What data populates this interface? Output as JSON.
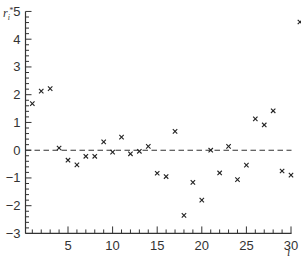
{
  "chart_data": {
    "type": "scatter",
    "title": "",
    "xlabel": "i",
    "ylabel": "r_i*",
    "ylabel_display": {
      "base": "r",
      "sub": "i",
      "sup": "*"
    },
    "xlim": [
      0,
      31
    ],
    "ylim": [
      -3,
      5
    ],
    "xticks": [
      5,
      10,
      15,
      20,
      25,
      30
    ],
    "yticks": [
      -3,
      -2,
      -1,
      0,
      1,
      2,
      3,
      4,
      5
    ],
    "x_minor_step": 1,
    "y_minor_step": 0.2,
    "grid": false,
    "marker": "x",
    "reference_line": {
      "y": 0,
      "style": "dashed"
    },
    "series": [
      {
        "name": "studentized residuals",
        "x": [
          1,
          2,
          3,
          4,
          5,
          6,
          7,
          8,
          9,
          10,
          11,
          12,
          13,
          14,
          15,
          16,
          17,
          18,
          19,
          20,
          21,
          22,
          23,
          24,
          25,
          26,
          27,
          28,
          29,
          30,
          31
        ],
        "values": [
          1.68,
          2.13,
          2.22,
          0.08,
          -0.36,
          -0.53,
          -0.22,
          -0.22,
          0.3,
          -0.07,
          0.47,
          -0.13,
          -0.04,
          0.14,
          -0.83,
          -0.95,
          0.68,
          -2.35,
          -1.16,
          -1.8,
          0.0,
          -0.82,
          0.14,
          -1.06,
          -0.54,
          1.13,
          0.91,
          1.42,
          -0.75,
          -0.9,
          4.62
        ]
      }
    ]
  },
  "colors": {
    "axis": "#333333",
    "marker": "#222222",
    "reference_line": "#333333",
    "background": "#ffffff"
  }
}
